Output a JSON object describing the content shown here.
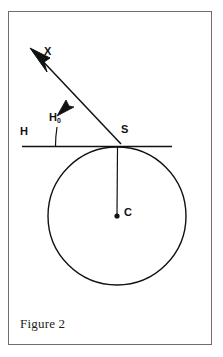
{
  "figure": {
    "caption": "Figure 2",
    "labels": {
      "ray": "X",
      "angle_main": "H",
      "angle_sub": "0",
      "horizon": "H",
      "tangent_point": "S",
      "center": "C"
    },
    "colors": {
      "ink": "#111111",
      "frame": "#6e6e6e",
      "background": "#ffffff"
    }
  },
  "diagram_data": {
    "type": "geometric-diagram",
    "description": "Circle with center C, horizontal tangent line H touching the circle at point S, and a ray X emanating from S at angle H0 above the horizontal.",
    "elements": [
      {
        "name": "circle",
        "shape": "circle",
        "center": [
          117,
          216
        ],
        "radius": 69,
        "stroke": "#111111",
        "fill": "none"
      },
      {
        "name": "center-point",
        "shape": "dot",
        "position": [
          117,
          216
        ],
        "radius": 2.6
      },
      {
        "name": "radius-line",
        "shape": "segment",
        "from": [
          117,
          147
        ],
        "to": [
          117,
          216
        ]
      },
      {
        "name": "horizon-line",
        "shape": "segment",
        "from": [
          22,
          146
        ],
        "to": [
          172,
          146
        ],
        "label": "H"
      },
      {
        "name": "ray-x",
        "shape": "ray",
        "from": [
          122,
          143
        ],
        "to": [
          33,
          51
        ],
        "label": "X",
        "arrowheads": 2
      },
      {
        "name": "angle-tick",
        "shape": "segment",
        "from": [
          55,
          128
        ],
        "to": [
          56,
          146
        ],
        "label": "H0"
      }
    ]
  }
}
